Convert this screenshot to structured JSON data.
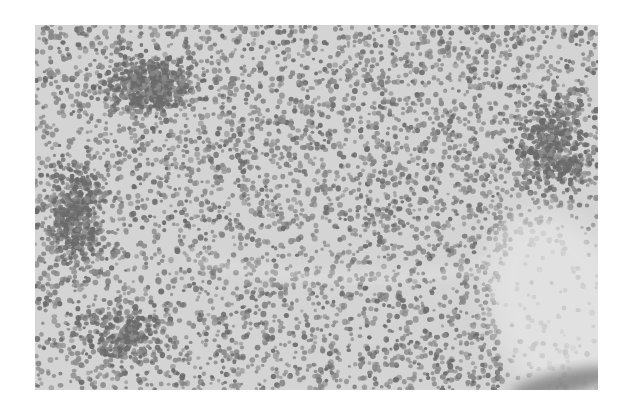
{
  "image": {
    "kind": "histology-micrograph",
    "description": "Grayscale H&E-style micrograph of densely packed small round lymphoid cells",
    "frame": {
      "x": 35,
      "y": 25,
      "width": 563,
      "height": 365
    },
    "colors": {
      "page_background": "#ffffff",
      "tissue_background": "#d4d4d4",
      "stroma_light": "#e6e6e6",
      "nucleus_dark": "#6a6a6a",
      "nucleus_mid": "#8a8a8a",
      "smudge": "#7a7a7a"
    },
    "cell_field": {
      "seed": 17,
      "count": 5200,
      "radius_min": 1.6,
      "radius_max": 3.0
    },
    "dense_clusters": [
      {
        "name": "upper-left-cluster",
        "cx": 110,
        "cy": 60,
        "rx": 70,
        "ry": 45,
        "extra": 500
      },
      {
        "name": "left-cluster",
        "cx": 40,
        "cy": 190,
        "rx": 45,
        "ry": 80,
        "extra": 450
      },
      {
        "name": "right-cluster",
        "cx": 520,
        "cy": 120,
        "rx": 55,
        "ry": 70,
        "extra": 420
      },
      {
        "name": "lower-left-cluster",
        "cx": 90,
        "cy": 310,
        "rx": 70,
        "ry": 45,
        "extra": 250
      }
    ],
    "light_regions": [
      {
        "name": "fibrous-stroma-lower-right",
        "cx": 530,
        "cy": 290,
        "rx": 70,
        "ry": 110,
        "opacity": 0.75
      },
      {
        "name": "diagonal-streak",
        "x1": 150,
        "y1": 230,
        "x2": 460,
        "y2": 240,
        "width": 10,
        "opacity": 0.5
      }
    ],
    "dark_smudge": {
      "cx": 530,
      "cy": 358,
      "rx": 55,
      "ry": 12
    }
  }
}
